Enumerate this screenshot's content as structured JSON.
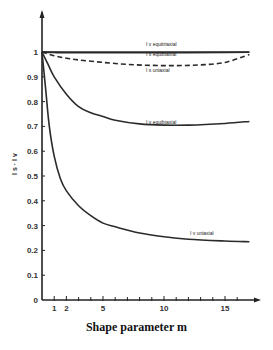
{
  "chart_data": {
    "type": "line",
    "title": "",
    "xlabel": "Shape parameter m",
    "ylabel": "I_s · I_v",
    "xlim": [
      0,
      17.5
    ],
    "ylim": [
      0,
      1.05
    ],
    "grid": false,
    "legend": "inline curve labels",
    "x_ticks": [
      1,
      2,
      5,
      10,
      15
    ],
    "x_minor_ticks": [
      1,
      2,
      3,
      4,
      5,
      6,
      7,
      8,
      9,
      10,
      11,
      12,
      13,
      14,
      15,
      16
    ],
    "y_ticks": [
      0,
      0.1,
      0.2,
      0.3,
      0.4,
      0.5,
      0.6,
      0.7,
      0.8,
      0.9,
      1
    ],
    "y_tick_labels": [
      "0",
      "0.1",
      "0.2",
      "0.3",
      "0.4",
      "0.5",
      "0.6",
      "0.7",
      "0.8",
      "0.9",
      "1"
    ],
    "series": [
      {
        "name": "I_v equitriaxial",
        "style": "solid",
        "x": [
          0,
          1,
          2,
          5,
          10,
          15,
          17
        ],
        "y": [
          1.0,
          1.0,
          1.0,
          1.0,
          1.0,
          1.0,
          1.0
        ]
      },
      {
        "name": "I_s equibiaxial",
        "style": "solid",
        "x": [
          0,
          1,
          2,
          5,
          10,
          15,
          17
        ],
        "y": [
          1.0,
          0.998,
          0.997,
          0.997,
          0.997,
          0.998,
          0.999
        ]
      },
      {
        "name": "I_s uniaxial",
        "style": "dashed",
        "x": [
          0,
          1,
          2,
          3,
          5,
          7,
          9,
          11,
          13,
          15,
          17
        ],
        "y": [
          1.0,
          0.985,
          0.975,
          0.968,
          0.958,
          0.95,
          0.946,
          0.945,
          0.948,
          0.958,
          0.99
        ]
      },
      {
        "name": "I_v equibiaxial",
        "style": "solid",
        "x": [
          0,
          0.5,
          1,
          2,
          3,
          4,
          5,
          6,
          8,
          10,
          12,
          15,
          17
        ],
        "y": [
          1.0,
          0.95,
          0.9,
          0.83,
          0.78,
          0.755,
          0.74,
          0.725,
          0.71,
          0.705,
          0.705,
          0.712,
          0.72
        ]
      },
      {
        "name": "I_v uniaxial",
        "style": "solid",
        "x": [
          0,
          0.3,
          0.6,
          1,
          1.5,
          2,
          3,
          4,
          5,
          6,
          8,
          10,
          12,
          15,
          17
        ],
        "y": [
          1.0,
          0.85,
          0.7,
          0.58,
          0.49,
          0.44,
          0.38,
          0.34,
          0.31,
          0.295,
          0.27,
          0.255,
          0.245,
          0.238,
          0.235
        ]
      }
    ]
  },
  "labels": {
    "xlabel": "Shape parameter m",
    "ylabel": "I s · I v",
    "curve_equitriaxial": "I v equitriaxial",
    "curve_s_equibiaxial": "I s equibiaxial",
    "curve_s_uniaxial": "I s uniaxial",
    "curve_v_equibiaxial": "I v equibiaxial",
    "curve_v_uniaxial": "I v uniaxial"
  }
}
